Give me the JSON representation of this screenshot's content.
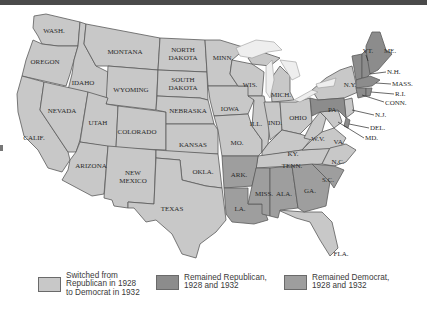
{
  "colors": {
    "switched": "#c8c8c8",
    "remained_republican": "#8c8c8c",
    "remained_democrat": "#9e9e9e",
    "background": "#ffffff",
    "top_bar": "#4a4a4a"
  },
  "states": {
    "wash": "WASH.",
    "oregon": "OREGON",
    "calif": "CALIF.",
    "idaho": "IDAHO",
    "nevada": "NEVADA",
    "montana": "MONTANA",
    "wyoming": "WYOMING",
    "utah": "UTAH",
    "arizona": "ARIZONA",
    "colorado": "COLORADO",
    "new_mexico_1": "NEW",
    "new_mexico_2": "MEXICO",
    "north_dakota_1": "NORTH",
    "north_dakota_2": "DAKOTA",
    "south_dakota_1": "SOUTH",
    "south_dakota_2": "DAKOTA",
    "nebraska": "NEBRASKA",
    "kansas": "KANSAS",
    "okla": "OKLA.",
    "texas": "TEXAS",
    "minn": "MINN.",
    "iowa": "IOWA",
    "mo": "MO.",
    "ark": "ARK.",
    "la": "LA.",
    "wis": "WIS.",
    "ill": "ILL.",
    "mich": "MICH.",
    "ind": "IND.",
    "ohio": "OHIO",
    "ky": "KY.",
    "tenn": "TENN.",
    "miss": "MISS.",
    "ala": "ALA.",
    "ga": "GA.",
    "fla": "FLA.",
    "sc": "S.C.",
    "nc": "N.C.",
    "va": "VA.",
    "wv": "W.V.",
    "pa": "PA.",
    "ny": "N.Y.",
    "vt": "VT.",
    "me": "ME.",
    "nh": "N.H.",
    "mass": "MASS.",
    "ri": "R.I.",
    "conn": "CONN.",
    "nj": "N.J.",
    "del": "DEL.",
    "md": "MD."
  },
  "legend": [
    {
      "label": "Switched from\nRepublican in 1928\nto Democrat in 1932",
      "color": "#c8c8c8"
    },
    {
      "label": "Remained Republican,\n1928 and 1932",
      "color": "#8c8c8c"
    },
    {
      "label": "Remained Democrat,\n1928 and 1932",
      "color": "#9e9e9e"
    }
  ],
  "groups": {
    "remained_republican": [
      "ME.",
      "VT.",
      "N.H.",
      "MASS.",
      "R.I.",
      "CONN.",
      "PA.",
      "DEL."
    ],
    "remained_democrat": [
      "ARK.",
      "LA.",
      "MISS.",
      "ALA.",
      "GA.",
      "S.C."
    ]
  }
}
